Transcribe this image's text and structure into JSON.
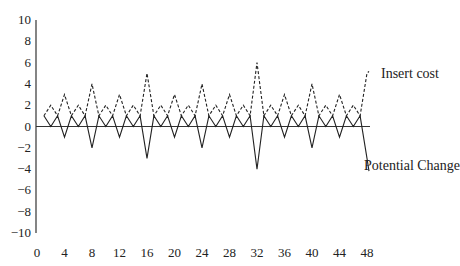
{
  "chart_data": {
    "type": "line",
    "title": "",
    "xlabel": "",
    "ylabel": "",
    "xlim": [
      0,
      48
    ],
    "ylim": [
      -10,
      10
    ],
    "x_ticks": [
      0,
      4,
      8,
      12,
      16,
      20,
      24,
      28,
      32,
      36,
      40,
      44,
      48
    ],
    "y_ticks": [
      10,
      8,
      6,
      4,
      2,
      0,
      -2,
      -4,
      -6,
      -8,
      -10
    ],
    "y_tick_labels": [
      "10",
      "8",
      "6",
      "4",
      "2",
      "0",
      "−2",
      "−4",
      "−6",
      "−8",
      "−10"
    ],
    "grid": false,
    "legend": "inline labels at right end of series",
    "x": [
      1,
      2,
      3,
      4,
      5,
      6,
      7,
      8,
      9,
      10,
      11,
      12,
      13,
      14,
      15,
      16,
      17,
      18,
      19,
      20,
      21,
      22,
      23,
      24,
      25,
      26,
      27,
      28,
      29,
      30,
      31,
      32,
      33,
      34,
      35,
      36,
      37,
      38,
      39,
      40,
      41,
      42,
      43,
      44,
      45,
      46,
      47,
      48
    ],
    "series": [
      {
        "name": "Insert cost",
        "style": "dashed",
        "values": [
          1,
          2,
          1,
          3,
          1,
          2,
          1,
          4,
          1,
          2,
          1,
          3,
          1,
          2,
          1,
          5,
          1,
          2,
          1,
          3,
          1,
          2,
          1,
          4,
          1,
          2,
          1,
          3,
          1,
          2,
          1,
          6,
          1,
          2,
          1,
          3,
          1,
          2,
          1,
          4,
          1,
          2,
          1,
          3,
          1,
          2,
          1,
          5
        ]
      },
      {
        "name": "Potential Change",
        "style": "solid",
        "values": [
          1,
          0,
          1,
          -1,
          1,
          0,
          1,
          -2,
          1,
          0,
          1,
          -1,
          1,
          0,
          1,
          -3,
          1,
          0,
          1,
          -1,
          1,
          0,
          1,
          -2,
          1,
          0,
          1,
          -1,
          1,
          0,
          1,
          -4,
          1,
          0,
          1,
          -1,
          1,
          0,
          1,
          -2,
          1,
          0,
          1,
          -1,
          1,
          0,
          1,
          -3
        ]
      }
    ],
    "annotations": [
      {
        "text": "Insert cost",
        "near_series": "Insert cost"
      },
      {
        "text": "Potential Change",
        "near_series": "Potential Change"
      }
    ]
  }
}
